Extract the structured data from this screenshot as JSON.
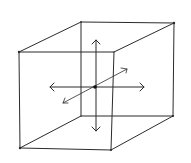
{
  "diagram": {
    "title": "Cube with 3D axis arrows",
    "stroke_color": "#2b2b2b",
    "background": "#ffffff",
    "cube": {
      "back_face": [
        [
          81,
          22
        ],
        [
          174,
          23
        ],
        [
          173,
          116
        ],
        [
          81,
          116
        ]
      ],
      "front_face": [
        [
          19,
          52
        ],
        [
          114,
          52
        ],
        [
          111,
          150
        ],
        [
          20,
          148
        ]
      ]
    },
    "center": [
      95,
      87
    ],
    "arrows": [
      {
        "name": "horizontal",
        "from": [
          50,
          87
        ],
        "to": [
          144,
          87
        ],
        "double_headed": true
      },
      {
        "name": "vertical",
        "from": [
          96,
          40
        ],
        "to": [
          96,
          131
        ],
        "double_headed": true
      },
      {
        "name": "depth",
        "from": [
          63,
          103
        ],
        "to": [
          127,
          69
        ],
        "double_headed": true
      }
    ]
  }
}
